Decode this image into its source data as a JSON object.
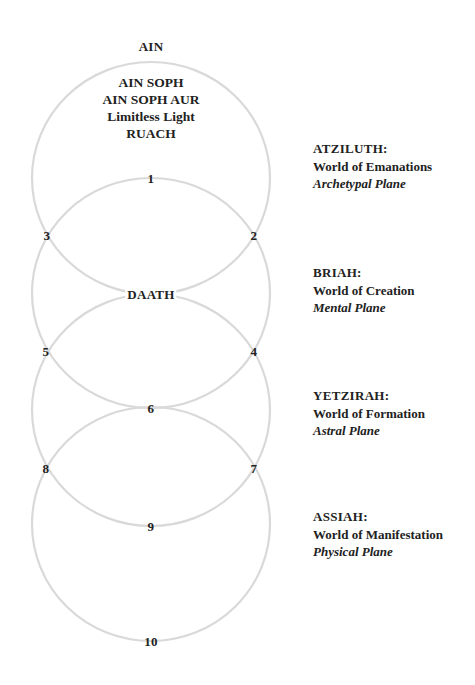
{
  "diagram": {
    "top_label": "AIN",
    "top_block": [
      "AIN SOPH",
      "AIN SOPH AUR",
      "Limitless Light",
      "RUACH"
    ],
    "ring_color": "#d9d9d9",
    "text_color": "#222222",
    "sephiroth": [
      {
        "id": "1",
        "label": "1",
        "x": 151,
        "y": 178
      },
      {
        "id": "2",
        "label": "2",
        "x": 254,
        "y": 235
      },
      {
        "id": "3",
        "label": "3",
        "x": 47,
        "y": 235
      },
      {
        "id": "daath",
        "label": "DAATH",
        "x": 151,
        "y": 294
      },
      {
        "id": "4",
        "label": "4",
        "x": 254,
        "y": 351
      },
      {
        "id": "5",
        "label": "5",
        "x": 46,
        "y": 351
      },
      {
        "id": "6",
        "label": "6",
        "x": 151,
        "y": 408
      },
      {
        "id": "7",
        "label": "7",
        "x": 254,
        "y": 468
      },
      {
        "id": "8",
        "label": "8",
        "x": 46,
        "y": 468
      },
      {
        "id": "9",
        "label": "9",
        "x": 151,
        "y": 526
      },
      {
        "id": "10",
        "label": "10",
        "x": 151,
        "y": 641
      }
    ],
    "rings": [
      {
        "cx": 151,
        "cy": 178,
        "rx": 119,
        "ry": 116
      },
      {
        "cx": 151,
        "cy": 293,
        "rx": 119,
        "ry": 115
      },
      {
        "cx": 151,
        "cy": 410,
        "rx": 119,
        "ry": 116
      },
      {
        "cx": 151,
        "cy": 524,
        "rx": 119,
        "ry": 117
      }
    ],
    "worlds": [
      {
        "name": "ATZILUTH:",
        "desc": "World of Emanations",
        "plane": "Archetypal Plane",
        "top": 140
      },
      {
        "name": "BRIAH:",
        "desc": "World of Creation",
        "plane": "Mental Plane",
        "top": 264
      },
      {
        "name": "YETZIRAH:",
        "desc": "World of Formation",
        "plane": "Astral Plane",
        "top": 387
      },
      {
        "name": "ASSIAH:",
        "desc": "World of Manifestation",
        "plane": "Physical Plane",
        "top": 508
      }
    ]
  }
}
